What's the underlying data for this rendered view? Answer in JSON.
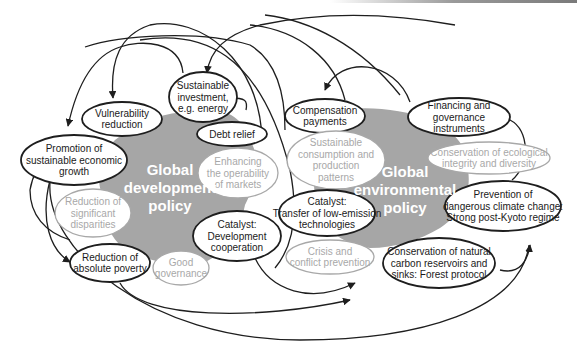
{
  "colors": {
    "blob": "#a6a6a6",
    "strong_stroke": "#1e1e1e",
    "muted_text": "#a8a8a8",
    "title_text": "#ffffff"
  },
  "regions": {
    "development": {
      "lines": [
        "Global",
        "development",
        "policy"
      ]
    },
    "environmental": {
      "lines": [
        "Global",
        "environmental",
        "policy"
      ]
    }
  },
  "nodes": {
    "sustainable_investment": {
      "lines": [
        "Sustainable",
        "investment,",
        "e.g. energy"
      ],
      "style": "strong"
    },
    "vulnerability_reduction": {
      "lines": [
        "Vulnerability",
        "reduction"
      ],
      "style": "strong"
    },
    "debt_relief": {
      "lines": [
        "Debt relief"
      ],
      "style": "strong"
    },
    "promotion_growth": {
      "lines": [
        "Promotion of",
        "sustainable economic",
        "growth"
      ],
      "style": "strong"
    },
    "enhancing_markets": {
      "lines": [
        "Enhancing",
        "the operability",
        "of markets"
      ],
      "style": "muted"
    },
    "reduction_disparities": {
      "lines": [
        "Reduction of",
        "significant",
        "disparities"
      ],
      "style": "muted"
    },
    "catalyst_development": {
      "lines": [
        "Catalyst:",
        "Development",
        "cooperation"
      ],
      "style": "strong"
    },
    "reduction_poverty": {
      "lines": [
        "Reduction of",
        "absolute poverty"
      ],
      "style": "strong"
    },
    "good_governance": {
      "lines": [
        "Good",
        "governance"
      ],
      "style": "muted"
    },
    "compensation_payments": {
      "lines": [
        "Compensation",
        "payments"
      ],
      "style": "strong"
    },
    "financing_instruments": {
      "lines": [
        "Financing and",
        "governance",
        "instruments"
      ],
      "style": "strong"
    },
    "sustainable_consumption": {
      "lines": [
        "Sustainable",
        "consumption and",
        "production",
        "patterns"
      ],
      "style": "muted"
    },
    "conservation_ecological": {
      "lines": [
        "Conservation of ecological",
        "integrity and diversity"
      ],
      "style": "muted"
    },
    "catalyst_transfer": {
      "lines": [
        "Catalyst:",
        "Transfer of low-emission",
        "technologies"
      ],
      "style": "strong"
    },
    "prevention_climate": {
      "lines": [
        "Prevention of",
        "dangerous climate change:",
        "Strong post-Kyoto regime"
      ],
      "style": "strong"
    },
    "crisis_prevention": {
      "lines": [
        "Crisis and",
        "conflict prevention"
      ],
      "style": "muted"
    },
    "conservation_carbon": {
      "lines": [
        "Conservation of natural",
        "carbon reservoirs and",
        "sinks: Forest protocol"
      ],
      "style": "strong"
    }
  }
}
